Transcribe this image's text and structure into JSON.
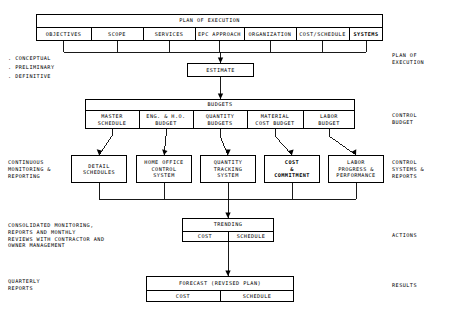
{
  "diagram": {
    "header_band": {
      "title": "PLAN OF EXECUTION",
      "columns": [
        "OBJECTIVES",
        "SCOPE",
        "SERVICES",
        "EPC APPROACH",
        "ORGANIZATION",
        "COST/SCHEDULE",
        "SYSTEMS"
      ]
    },
    "phase_list": [
      ". CONCEPTUAL",
      ". PRELIMINARY",
      ". DEFINITIVE"
    ],
    "estimate": {
      "label": "ESTIMATE"
    },
    "budgets_band": {
      "title": "BUDGETS",
      "columns": [
        "MASTER\nSCHEDULE",
        "ENG. & H.O.\nBUDGET",
        "QUANTITY\nBUDGETS",
        "MATERIAL\nCOST BUDGET",
        "LABOR\nBUDGET"
      ]
    },
    "control_systems": [
      "DETAIL\nSCHEDULES",
      "HOME OFFICE\nCONTROL\nSYSTEM",
      "QUANTITY\nTRACKING\nSYSTEM",
      "COST\n&\nCOMMITMENT",
      "LABOR\nPROGRESS &\nPERFORMANCE"
    ],
    "trending": {
      "title": "TRENDING",
      "sub": [
        "COST",
        "SCHEDULE"
      ]
    },
    "forecast": {
      "title": "FORECAST (REVISED PLAN)",
      "sub": [
        "COST",
        "SCHEDULE"
      ]
    },
    "left_labels": {
      "monitoring": "CONTINUOUS\nMONITORING &\nREPORTING",
      "consolidated": "CONSOLIDATED MONITORING,\nREPORTS AND MONTHLY\nREVIEWS WITH CONTRACTOR AND\nOWNER MANAGEMENT",
      "quarterly": "QUARTERLY\nREPORTS"
    },
    "right_labels": {
      "plan": "PLAN OF\nEXECUTION",
      "budget": "CONTROL\nBUDGET",
      "systems": "CONTROL\nSYSTEMS &\nREPORTS",
      "actions": "ACTIONS",
      "results": "RESULTS"
    },
    "colors": {
      "line": "#000000",
      "background": "#ffffff"
    }
  }
}
